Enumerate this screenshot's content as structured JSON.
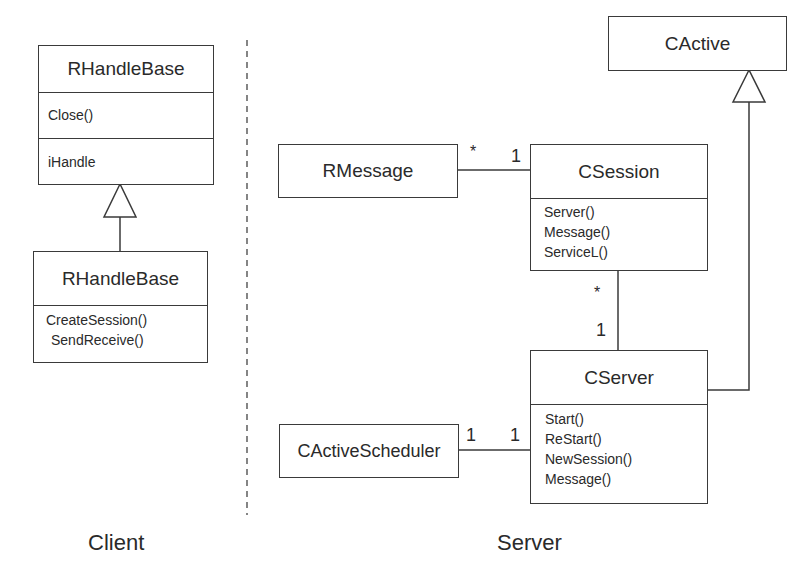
{
  "diagram": {
    "type": "UML class diagram",
    "regions": {
      "client_label": "Client",
      "server_label": "Server"
    },
    "classes": {
      "rhandlebase_top": {
        "name": "RHandleBase",
        "operations": [
          "Close()"
        ],
        "attributes": [
          "iHandle"
        ]
      },
      "rhandlebase_bottom": {
        "name": "RHandleBase",
        "operations": [
          "CreateSession()",
          "SendReceive()"
        ]
      },
      "rmessage": {
        "name": "RMessage"
      },
      "csession": {
        "name": "CSession",
        "operations": [
          "Server()",
          "Message()",
          "ServiceL()"
        ]
      },
      "cactive": {
        "name": "CActive"
      },
      "cserver": {
        "name": "CServer",
        "operations": [
          "Start()",
          "ReStart()",
          "NewSession()",
          "Message()"
        ]
      },
      "cactivescheduler": {
        "name": "CActiveScheduler"
      }
    },
    "associations": {
      "rmessage_csession": {
        "from_mult": "*",
        "to_mult": "1"
      },
      "csession_cserver": {
        "from_mult": "*",
        "to_mult": "1"
      },
      "scheduler_cserver": {
        "from_mult": "1",
        "to_mult": "1"
      }
    },
    "generalizations": [
      {
        "child": "RHandleBase (client)",
        "parent": "RHandleBase"
      },
      {
        "child": "CServer",
        "parent": "CActive"
      }
    ]
  }
}
